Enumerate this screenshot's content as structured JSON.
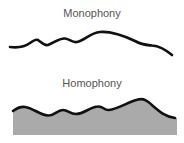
{
  "diagram": {
    "panels": [
      {
        "title": "Monophony",
        "style": {
          "stroke": "#111111",
          "fill": "none"
        }
      },
      {
        "title": "Homophony",
        "style": {
          "stroke": "#111111",
          "fill": "#aaaaaa"
        }
      }
    ],
    "colors": {
      "label": "#555555",
      "line": "#111111",
      "fill": "#aaaaaa",
      "background": "#ffffff"
    }
  }
}
